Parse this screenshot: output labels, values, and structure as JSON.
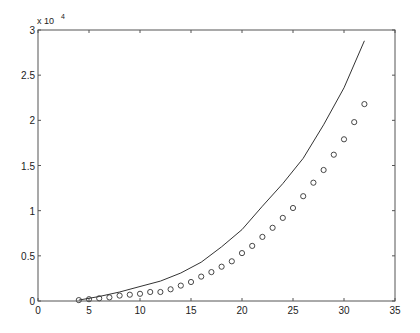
{
  "chart_data": {
    "type": "line",
    "title": "",
    "xlabel": "",
    "ylabel": "",
    "y_multiplier_label": "x 10",
    "y_multiplier_exponent": "4",
    "xlim": [
      0,
      35
    ],
    "ylim": [
      0,
      30000
    ],
    "grid": false,
    "legend": null,
    "x_ticks": [
      0,
      5,
      10,
      15,
      20,
      25,
      30,
      35
    ],
    "x_tick_labels": [
      "0",
      "5",
      "10",
      "15",
      "20",
      "25",
      "30",
      "35"
    ],
    "y_ticks": [
      0,
      5000,
      10000,
      15000,
      20000,
      25000,
      30000
    ],
    "y_tick_labels": [
      "0",
      "0.5",
      "1",
      "1.5",
      "2",
      "2.5",
      "3"
    ],
    "series": [
      {
        "name": "line",
        "style": "solid-line",
        "color": "#333333",
        "x": [
          4,
          5,
          6,
          8,
          10,
          12,
          14,
          16,
          18,
          20,
          22,
          24,
          26,
          28,
          30,
          32
        ],
        "y": [
          100,
          300,
          500,
          1000,
          1600,
          2200,
          3100,
          4300,
          6000,
          7900,
          10500,
          13000,
          15800,
          19500,
          23600,
          28800
        ]
      },
      {
        "name": "circles",
        "style": "open-circle-markers",
        "color": "#333333",
        "x": [
          4,
          5,
          6,
          7,
          8,
          9,
          10,
          11,
          12,
          13,
          14,
          15,
          16,
          17,
          18,
          19,
          20,
          21,
          22,
          23,
          24,
          25,
          26,
          27,
          28,
          29,
          30,
          31,
          32
        ],
        "y": [
          100,
          200,
          300,
          400,
          600,
          700,
          800,
          1000,
          1000,
          1300,
          1700,
          2100,
          2700,
          3200,
          3800,
          4400,
          5300,
          6100,
          7100,
          8100,
          9200,
          10300,
          11600,
          13100,
          14500,
          16200,
          17900,
          19800,
          21800
        ]
      }
    ]
  }
}
